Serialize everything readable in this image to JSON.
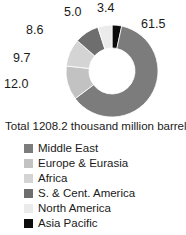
{
  "chart_data": {
    "type": "pie",
    "title": "",
    "subtitle": "",
    "xlabel": "",
    "ylabel": "",
    "caption": "Total 1208.2 thousand million barrels",
    "total": 1208.2,
    "unit": "thousand million barrels",
    "donut": true,
    "inner_radius_ratio": 0.5,
    "legend_position": "bottom",
    "grid": false,
    "value_labels_outside": true,
    "categories": [
      "Middle East",
      "Europe & Eurasia",
      "Africa",
      "S. & Cent. America",
      "North America",
      "Asia Pacific"
    ],
    "values": [
      61.5,
      12.0,
      9.7,
      8.6,
      5.0,
      3.4
    ],
    "colors": [
      "#7c7c7c",
      "#c2c2c2",
      "#d4d4d4",
      "#6e6e6e",
      "#ebebeb",
      "#0d0d0d"
    ],
    "slices": [
      {
        "label": "Middle East",
        "value": 61.5,
        "value_text": "61.5",
        "color": "#7c7c7c"
      },
      {
        "label": "Europe & Eurasia",
        "value": 12.0,
        "value_text": "12.0",
        "color": "#c2c2c2"
      },
      {
        "label": "Africa",
        "value": 9.7,
        "value_text": "9.7",
        "color": "#d4d4d4"
      },
      {
        "label": "S. & Cent. America",
        "value": 8.6,
        "value_text": "8.6",
        "color": "#6e6e6e"
      },
      {
        "label": "North America",
        "value": 5.0,
        "value_text": "5.0",
        "color": "#ebebeb"
      },
      {
        "label": "Asia Pacific",
        "value": 3.4,
        "value_text": "3.4",
        "color": "#0d0d0d"
      }
    ]
  },
  "legend": {
    "items": [
      {
        "label": "Middle East",
        "color": "#7c7c7c"
      },
      {
        "label": "Europe & Eurasia",
        "color": "#c2c2c2"
      },
      {
        "label": "Africa",
        "color": "#d4d4d4"
      },
      {
        "label": "S. & Cent. America",
        "color": "#6e6e6e"
      },
      {
        "label": "North America",
        "color": "#ebebeb"
      },
      {
        "label": "Asia Pacific",
        "color": "#0d0d0d"
      }
    ]
  }
}
